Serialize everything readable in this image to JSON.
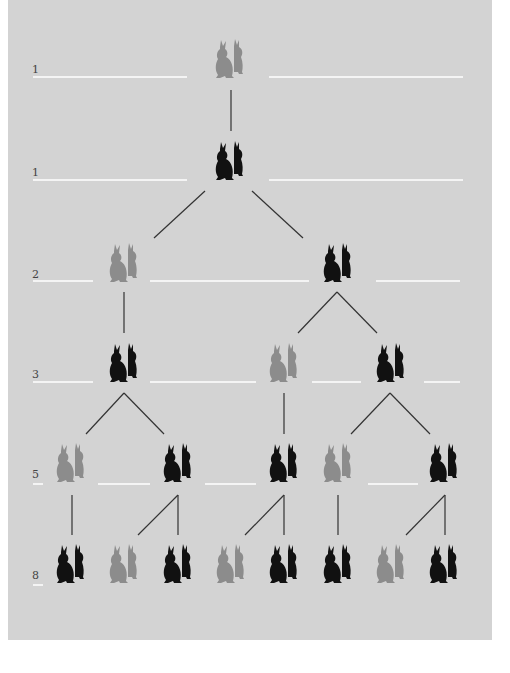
{
  "colors": {
    "background": "#d3d3d3",
    "adult_pair": "#111111",
    "young_pair": "#8c8c8c",
    "guide_line": "#f4f4f4",
    "connector": "#333333"
  },
  "generations": [
    {
      "count": "1",
      "y": 75
    },
    {
      "count": "1",
      "y": 180
    },
    {
      "count": "2",
      "y": 282
    },
    {
      "count": "3",
      "y": 383
    },
    {
      "count": "5",
      "y": 484
    },
    {
      "count": "8",
      "y": 584
    }
  ],
  "legend": {
    "adult": "adult-pair-icon (black)",
    "young": "young-pair-icon (grey)"
  }
}
